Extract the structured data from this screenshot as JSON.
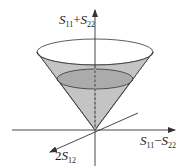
{
  "figure": {
    "colors": {
      "cone_fill": "#bdbdbd",
      "inner_disc_fill": "#a9a9a9",
      "stroke": "#333333",
      "background": "#ffffff"
    },
    "axes": {
      "vertical": {
        "label_main": "S",
        "label_sub1": "11",
        "label_op": "+",
        "label_main2": "S",
        "label_sub2": "22"
      },
      "horizontal": {
        "label_main": "S",
        "label_sub1": "11",
        "label_op": "−",
        "label_main2": "S",
        "label_sub2": "22"
      },
      "diagonal": {
        "label_prefix": "2",
        "label_main": "S",
        "label_sub1": "12"
      }
    },
    "shapes": [
      "cone",
      "top-ellipse",
      "inner-ellipse",
      "apex-at-origin"
    ]
  }
}
